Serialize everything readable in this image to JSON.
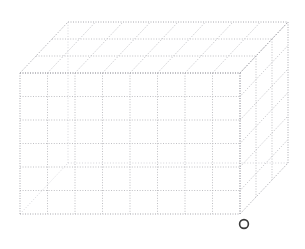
{
  "canvas": {
    "width": 305,
    "height": 249,
    "background": "#ffffff"
  },
  "figure": {
    "title": "",
    "kind": "wireframe-cuboid",
    "line_color": "#b9b9bd",
    "edge_color": "#a8a8ae",
    "faint_color": "#cfcfd4",
    "marker_color": "#3a3a3a"
  },
  "geometry": {
    "front_face": {
      "x0": 20,
      "y0": 73,
      "x1": 240,
      "y1": 214,
      "columns": 8,
      "rows": 6
    },
    "depth": {
      "dx": 48,
      "dy": -51,
      "divisions": 3
    }
  },
  "marker": {
    "label": "o",
    "shape": "circle-outline",
    "cx": 244,
    "cy": 224,
    "r": 4.4,
    "color": "#3a3a3a"
  }
}
